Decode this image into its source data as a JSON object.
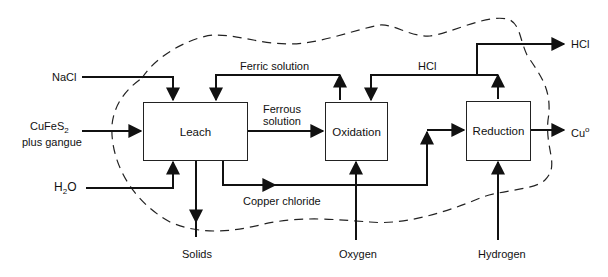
{
  "diagram": {
    "type": "process-flow",
    "boundary": "dashed closed curve enclosing the process units",
    "units": [
      {
        "id": "leach",
        "label": "Leach"
      },
      {
        "id": "oxidation",
        "label": "Oxidation"
      },
      {
        "id": "reduction",
        "label": "Reduction"
      }
    ],
    "inputs": {
      "nacl": "NaCl",
      "cufes2_main": "CuFeS",
      "cufes2_sub": "2",
      "cufes2_line2": "plus gangue",
      "h2o_h": "H",
      "h2o_sub": "2",
      "h2o_o": "O",
      "oxygen": "Oxygen",
      "hydrogen": "Hydrogen"
    },
    "outputs": {
      "solids": "Solids",
      "hcl_out": "HCl",
      "cu_main": "Cu",
      "cu_sup": "o"
    },
    "streams": {
      "ferric": "Ferric  solution",
      "ferrous_line1": "Ferrous",
      "ferrous_line2": "solution",
      "hcl_recycle": "HCl",
      "copper_chloride": "Copper chloride"
    },
    "edges": [
      {
        "from": "NaCl",
        "to": "leach"
      },
      {
        "from": "CuFeS2 plus gangue",
        "to": "leach"
      },
      {
        "from": "H2O",
        "to": "leach"
      },
      {
        "from": "leach",
        "to": "Solids"
      },
      {
        "from": "leach",
        "to": "oxidation",
        "label": "Ferrous solution"
      },
      {
        "from": "oxidation",
        "to": "leach",
        "label": "Ferric solution"
      },
      {
        "from": "leach",
        "to": "reduction",
        "label": "Copper chloride"
      },
      {
        "from": "Oxygen",
        "to": "oxidation"
      },
      {
        "from": "reduction",
        "to": "oxidation",
        "label": "HCl"
      },
      {
        "from": "reduction",
        "to": "HCl"
      },
      {
        "from": "reduction",
        "to": "Cu°"
      },
      {
        "from": "Hydrogen",
        "to": "reduction"
      }
    ]
  }
}
